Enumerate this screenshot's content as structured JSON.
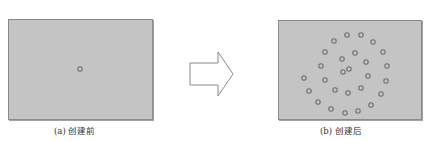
{
  "figure": {
    "colors": {
      "panel_fill": "#c4c4c4",
      "panel_border": "#8a8a8a",
      "circle_stroke": "#6e6e6e",
      "arrow_stroke": "#8a8a8a",
      "caption_text": "#333333"
    },
    "panels": [
      {
        "id": "before",
        "caption": "(a) 创建前",
        "circles": [
          {
            "x": 80,
            "y": 69
          }
        ]
      },
      {
        "id": "after",
        "caption": "(b) 创建后",
        "circles": [
          {
            "x": 347,
            "y": 35
          },
          {
            "x": 361,
            "y": 35
          },
          {
            "x": 334,
            "y": 41
          },
          {
            "x": 373,
            "y": 42
          },
          {
            "x": 325,
            "y": 52
          },
          {
            "x": 355,
            "y": 53
          },
          {
            "x": 383,
            "y": 52
          },
          {
            "x": 342,
            "y": 59
          },
          {
            "x": 366,
            "y": 62
          },
          {
            "x": 321,
            "y": 66
          },
          {
            "x": 387,
            "y": 66
          },
          {
            "x": 349,
            "y": 69
          },
          {
            "x": 343,
            "y": 72
          },
          {
            "x": 368,
            "y": 76
          },
          {
            "x": 304,
            "y": 78
          },
          {
            "x": 325,
            "y": 80
          },
          {
            "x": 386,
            "y": 81
          },
          {
            "x": 309,
            "y": 91
          },
          {
            "x": 335,
            "y": 90
          },
          {
            "x": 348,
            "y": 93
          },
          {
            "x": 361,
            "y": 88
          },
          {
            "x": 381,
            "y": 94
          },
          {
            "x": 318,
            "y": 102
          },
          {
            "x": 371,
            "y": 105
          },
          {
            "x": 331,
            "y": 109
          },
          {
            "x": 345,
            "y": 113
          },
          {
            "x": 358,
            "y": 111
          }
        ]
      }
    ],
    "arrow": {
      "direction": "right",
      "icon": "right-arrow-icon"
    }
  }
}
